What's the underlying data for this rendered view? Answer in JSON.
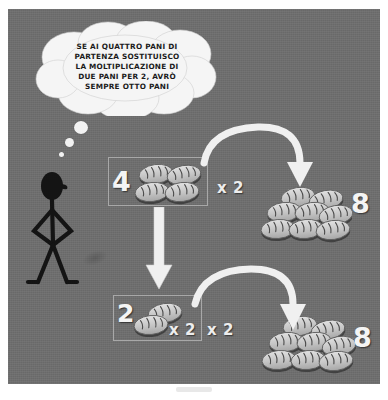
{
  "panel": {
    "background_color": "#6e6e6e",
    "frame_color": "#ffffff"
  },
  "thought_bubble": {
    "name": "thought-bubble",
    "fill_color": "#f5f5f5",
    "lines": [
      "SE AI QUATTRO PANI DI",
      "PARTENZA SOSTITUISCO",
      "LA MOLTIPLICAZIONE DI",
      "DUE PANI PER 2, AVRÒ",
      "SEMPRE OTTO PANI"
    ],
    "full_text": "SE AI QUATTRO PANI DI PARTENZA SOSTITUISCO LA MOLTIPLICAZIONE DI DUE PANI PER 2, AVRÒ SEMPRE OTTO PANI"
  },
  "character": {
    "name": "stick-figure",
    "color": "#141414",
    "pose": "hands-on-hips"
  },
  "rows": [
    {
      "id": "top-row",
      "group_label": "4",
      "group_bread_count": 4,
      "multiplier_label": "x 2",
      "result_label": "8",
      "result_bread_count": 8
    },
    {
      "id": "bottom-row",
      "group_label": "2",
      "group_bread_count": 2,
      "multiplier_inner_label": "x 2",
      "multiplier_outer_label": "x 2",
      "result_label": "8",
      "result_bread_count": 8
    }
  ],
  "arrows": [
    {
      "name": "arrow-curve-top",
      "direction": "right",
      "color": "#f0f0f0"
    },
    {
      "name": "arrow-down",
      "direction": "down",
      "color": "#f0f0f0"
    },
    {
      "name": "arrow-curve-bottom",
      "direction": "right",
      "color": "#f0f0f0"
    }
  ],
  "colors": {
    "bread_light": "#d9d9d9",
    "bread_mid": "#b4b4b4",
    "bread_shadow": "#3f3f3f",
    "numeral": "#f4f4f4",
    "box_outline": "#a8a8a8"
  }
}
